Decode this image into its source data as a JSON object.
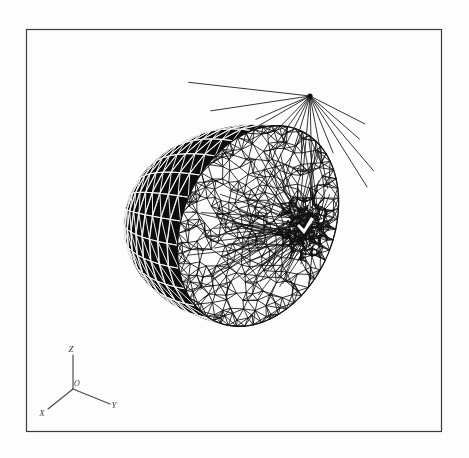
{
  "figure": {
    "type": "3d-mesh-visualization",
    "background_color": "#fdfdfd",
    "line_color": "#111111",
    "shaded_facet_color": "#0d0d0d",
    "shaded_edge_color": "#f2f2f2",
    "frame": {
      "name": "plot-frame",
      "color": "#3a3a3a",
      "line_width": 1.2,
      "x": 26,
      "y": 29,
      "width": 415,
      "height": 402
    },
    "mesh": {
      "name": "hemisphere-mesh",
      "center_x": 258,
      "center_y": 226,
      "radius_x": 138,
      "radius_y": 174,
      "tilt_deg": -8,
      "shaded_region_label": "curved dome surface (shaded)",
      "wireframe_region_label": "flat cut face (wireframe)",
      "lat_bands": 16,
      "lon_bands": 26,
      "refinement_cluster": {
        "name": "dense-refinement-cluster",
        "x": 305,
        "y": 228,
        "radius": 26,
        "node_count": 190
      },
      "radial_hub": {
        "name": "radial-hub-node",
        "x": 310,
        "y": 96,
        "spokes": 34
      },
      "unstructured_nodes": 260
    },
    "axis_triad": {
      "name": "axis-triad",
      "origin": {
        "label": "O",
        "x": 73,
        "y": 389
      },
      "axes": [
        {
          "label": "Z",
          "name": "axis-z",
          "tip_x": 73,
          "tip_y": 355,
          "label_x": 71,
          "label_y": 350
        },
        {
          "label": "Y",
          "name": "axis-y",
          "tip_x": 110,
          "tip_y": 404,
          "label_x": 114,
          "label_y": 406
        },
        {
          "label": "X",
          "name": "axis-x",
          "tip_x": 48,
          "tip_y": 409,
          "label_x": 42,
          "label_y": 414
        }
      ]
    }
  }
}
